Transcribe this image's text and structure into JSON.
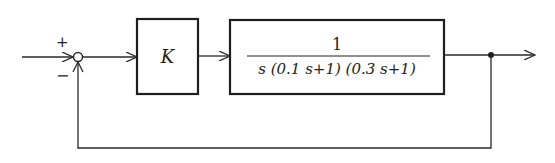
{
  "diagram": {
    "type": "feedback-control-block-diagram",
    "summing_junction": {
      "plus_sign": "+",
      "minus_sign": "−"
    },
    "controller_block": {
      "label": "K"
    },
    "plant_block": {
      "numerator": "1",
      "denominator": "s (0.1 s+1) (0.3 s+1)"
    },
    "feedback": "unity negative feedback"
  }
}
